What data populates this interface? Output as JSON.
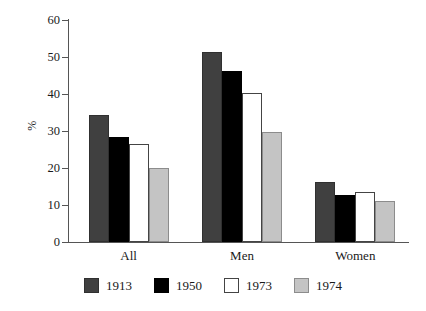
{
  "chart_data": {
    "type": "bar",
    "title": "",
    "subtitle": "",
    "xlabel": "",
    "ylabel": "%",
    "categories": [
      "All",
      "Men",
      "Women"
    ],
    "series": [
      {
        "name": "1913",
        "color": "#404040",
        "values": [
          34.2,
          51.3,
          16.3
        ]
      },
      {
        "name": "1950",
        "color": "#000000",
        "values": [
          28.3,
          46.2,
          12.7
        ]
      },
      {
        "name": "1973",
        "color": "#ffffff",
        "values": [
          26.5,
          40.3,
          13.5
        ]
      },
      {
        "name": "1974",
        "color": "#c4c4c4",
        "values": [
          20.1,
          29.6,
          11.1
        ]
      }
    ],
    "ylim": [
      0,
      60
    ],
    "yticks": [
      0,
      10,
      20,
      30,
      40,
      50,
      60
    ],
    "ytick_labels": [
      "0",
      "10",
      "20",
      "30",
      "40",
      "50",
      "60"
    ],
    "grid": false,
    "legend_position": "bottom",
    "legend_entries": [
      "1913",
      "1950",
      "1973",
      "1974"
    ],
    "annotations": []
  }
}
